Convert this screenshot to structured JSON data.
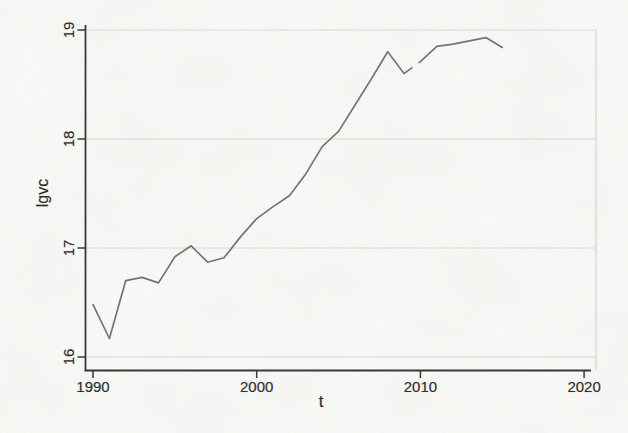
{
  "figure": {
    "title": "",
    "xlabel": "t",
    "ylabel": "lgvc"
  },
  "chart_data": {
    "type": "line",
    "title": "",
    "xlabel": "t",
    "ylabel": "lgvc",
    "legend": "none",
    "grid": "horizontal",
    "xlim": [
      1989.5,
      2020.4
    ],
    "ylim": [
      16,
      19
    ],
    "x_ticks": [
      1990,
      2000,
      2010,
      2020
    ],
    "y_ticks": [
      16,
      17,
      18,
      19
    ],
    "x": [
      1990,
      1991,
      1992,
      1993,
      1994,
      1995,
      1996,
      1997,
      1998,
      1999,
      2000,
      2001,
      2002,
      2003,
      2004,
      2005,
      2006,
      2007,
      2008,
      2009,
      2010,
      2011,
      2012,
      2013,
      2014,
      2015
    ],
    "series": [
      {
        "name": "lgvc",
        "values": [
          16.48,
          16.17,
          16.7,
          16.73,
          16.68,
          16.92,
          17.02,
          16.87,
          16.91,
          17.1,
          17.27,
          17.38,
          17.48,
          17.68,
          17.93,
          18.07,
          18.31,
          18.55,
          18.8,
          18.6,
          18.71,
          18.85,
          18.87,
          18.9,
          18.93,
          18.84
        ]
      }
    ],
    "colors": {
      "line": "#6e6e6e",
      "axis": "#2b2b2b",
      "gridline": "#dadad6",
      "plot_border_right": "#cfcfcb",
      "background": "#fcfcfa",
      "tick_label": "#1f1f1f"
    }
  }
}
